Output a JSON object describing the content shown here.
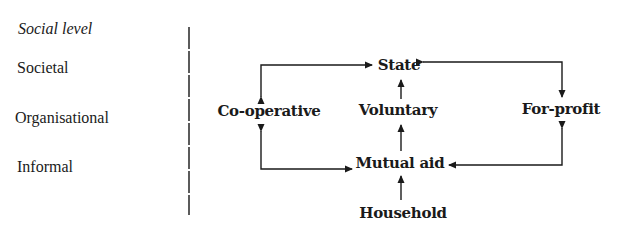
{
  "levels": {
    "heading": "Social level",
    "items": [
      {
        "label": "Societal"
      },
      {
        "label": "Organisational"
      },
      {
        "label": "Informal"
      }
    ]
  },
  "nodes": {
    "state": "State",
    "cooperative": "Co-operative",
    "voluntary": "Voluntary",
    "for_profit": "For-profit",
    "mutual_aid": "Mutual aid",
    "household": "Household"
  },
  "edges": [
    {
      "from": "state",
      "to": "cooperative",
      "bidirectional": true
    },
    {
      "from": "state",
      "to": "for_profit",
      "bidirectional": true
    },
    {
      "from": "voluntary",
      "to": "state",
      "bidirectional": false
    },
    {
      "from": "mutual_aid",
      "to": "voluntary",
      "bidirectional": false
    },
    {
      "from": "mutual_aid",
      "to": "cooperative",
      "bidirectional": true
    },
    {
      "from": "mutual_aid",
      "to": "for_profit",
      "bidirectional": true
    },
    {
      "from": "household",
      "to": "mutual_aid",
      "bidirectional": false
    }
  ],
  "colors": {
    "ink": "#1a1a1a",
    "background": "#ffffff"
  }
}
